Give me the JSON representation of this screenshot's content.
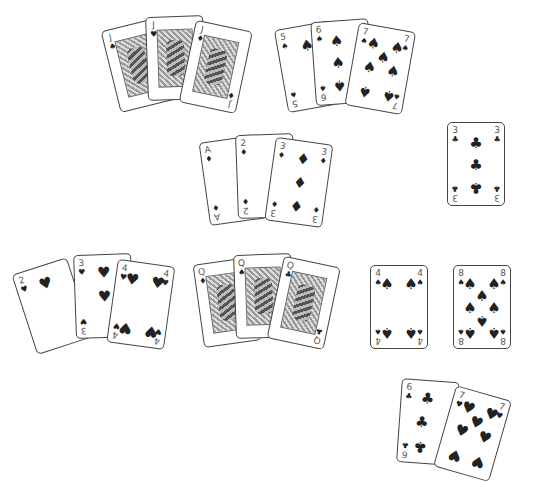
{
  "table": {
    "background": "#ffffff"
  },
  "groups": [
    {
      "name": "jacks",
      "cards": [
        {
          "rank": "J",
          "suit": "♠"
        },
        {
          "rank": "J",
          "suit": "♥"
        },
        {
          "rank": "J",
          "suit": "♦"
        }
      ]
    },
    {
      "name": "spades-run",
      "cards": [
        {
          "rank": "5",
          "suit": "♠"
        },
        {
          "rank": "6",
          "suit": "♠"
        },
        {
          "rank": "7",
          "suit": "♠"
        }
      ]
    },
    {
      "name": "diamonds-run",
      "cards": [
        {
          "rank": "A",
          "suit": "♦"
        },
        {
          "rank": "2",
          "suit": "♦"
        },
        {
          "rank": "3",
          "suit": "♦"
        }
      ]
    },
    {
      "name": "single-three-clubs",
      "cards": [
        {
          "rank": "3",
          "suit": "♣"
        }
      ]
    },
    {
      "name": "hearts-run",
      "cards": [
        {
          "rank": "2",
          "suit": "♥"
        },
        {
          "rank": "3",
          "suit": "♥"
        },
        {
          "rank": "4",
          "suit": "♥"
        }
      ]
    },
    {
      "name": "queens",
      "cards": [
        {
          "rank": "Q",
          "suit": "♦"
        },
        {
          "rank": "Q",
          "suit": "♠"
        },
        {
          "rank": "Q",
          "suit": "♣"
        }
      ]
    },
    {
      "name": "single-four-spades",
      "cards": [
        {
          "rank": "4",
          "suit": "♠"
        }
      ]
    },
    {
      "name": "single-eight-spades",
      "cards": [
        {
          "rank": "8",
          "suit": "♠"
        }
      ]
    },
    {
      "name": "six-seven",
      "cards": [
        {
          "rank": "6",
          "suit": "♣"
        },
        {
          "rank": "7",
          "suit": "♥"
        }
      ]
    }
  ]
}
